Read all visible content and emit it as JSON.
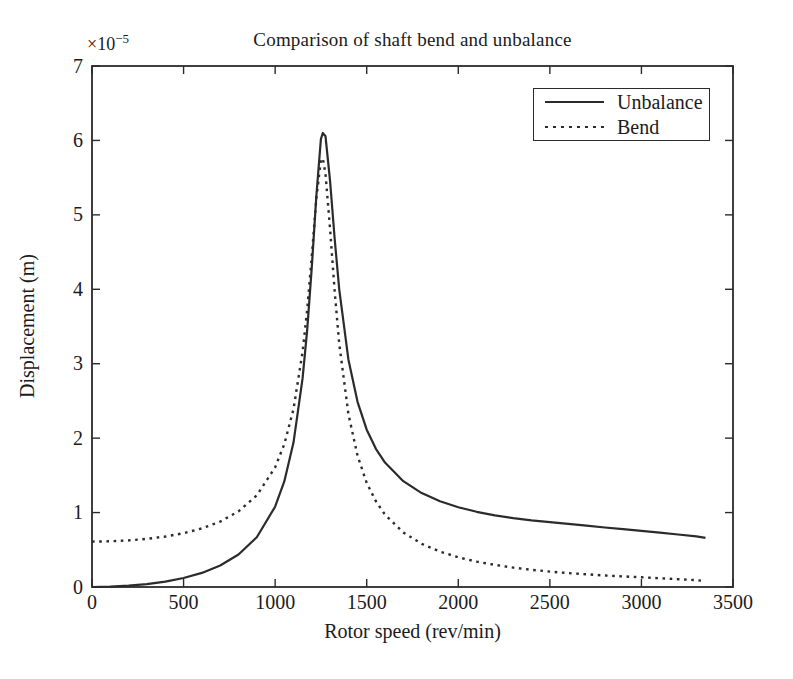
{
  "figure": {
    "title": "Comparison of shaft bend and unbalance",
    "y_multiplier_base": "×10",
    "y_multiplier_exponent": "−5",
    "xlabel": "Rotor speed (rev/min)",
    "ylabel": "Displacement (m)"
  },
  "legend": {
    "items": [
      {
        "label": "Unbalance",
        "style": "solid"
      },
      {
        "label": "Bend",
        "style": "dotted"
      }
    ]
  },
  "colors": {
    "line": "#2b2b2b",
    "text": "#1b1b1b",
    "background": "#ffffff"
  },
  "chart_data": {
    "type": "line",
    "title": "Comparison of shaft bend and unbalance",
    "xlabel": "Rotor speed (rev/min)",
    "ylabel": "Displacement (m)",
    "y_unit_multiplier": "1e-5 m",
    "xlim": [
      0,
      3500
    ],
    "ylim": [
      0,
      7
    ],
    "x_ticks": [
      0,
      500,
      1000,
      1500,
      2000,
      2500,
      3000,
      3500
    ],
    "y_ticks": [
      0,
      1,
      2,
      3,
      4,
      5,
      6,
      7
    ],
    "grid": false,
    "legend_position": "top-right",
    "resonance_speed_rev_min": 1260,
    "x": [
      0,
      100,
      200,
      300,
      400,
      500,
      600,
      700,
      800,
      900,
      1000,
      1050,
      1100,
      1150,
      1175,
      1200,
      1225,
      1250,
      1260,
      1275,
      1300,
      1325,
      1350,
      1400,
      1450,
      1500,
      1550,
      1600,
      1700,
      1800,
      1900,
      2000,
      2100,
      2200,
      2300,
      2400,
      2500,
      2600,
      2700,
      2800,
      2900,
      3000,
      3100,
      3200,
      3300,
      3350
    ],
    "series": [
      {
        "name": "Unbalance",
        "style": "solid",
        "values": [
          0,
          0.004,
          0.017,
          0.039,
          0.073,
          0.121,
          0.19,
          0.289,
          0.436,
          0.669,
          1.079,
          1.419,
          1.94,
          2.806,
          3.455,
          4.298,
          5.264,
          6.018,
          6.1,
          6.057,
          5.45,
          4.676,
          4.002,
          3.058,
          2.484,
          2.113,
          1.857,
          1.672,
          1.421,
          1.261,
          1.151,
          1.071,
          1.011,
          0.963,
          0.926,
          0.895,
          0.87,
          0.848,
          0.825,
          0.8,
          0.778,
          0.755,
          0.73,
          0.705,
          0.68,
          0.66
        ]
      },
      {
        "name": "Bend",
        "style": "dotted",
        "values": [
          0.61,
          0.614,
          0.626,
          0.646,
          0.678,
          0.723,
          0.787,
          0.879,
          1.016,
          1.231,
          1.607,
          1.918,
          2.39,
          3.161,
          3.729,
          4.446,
          5.226,
          5.737,
          5.76,
          5.551,
          4.805,
          3.968,
          3.271,
          2.325,
          1.761,
          1.399,
          1.152,
          0.973,
          0.733,
          0.58,
          0.475,
          0.399,
          0.341,
          0.297,
          0.261,
          0.231,
          0.207,
          0.187,
          0.17,
          0.155,
          0.142,
          0.13,
          0.118,
          0.105,
          0.092,
          0.08
        ]
      }
    ]
  }
}
